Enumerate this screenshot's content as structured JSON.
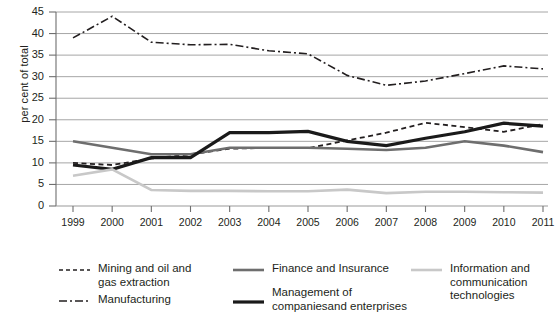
{
  "chart_data": {
    "type": "line",
    "title": "",
    "xlabel": "",
    "ylabel": "per cent of total",
    "ylim": [
      0,
      45
    ],
    "ytick_step": 5,
    "yticks": [
      0,
      5,
      10,
      15,
      20,
      25,
      30,
      35,
      40,
      45
    ],
    "grid": true,
    "legend_position": "bottom",
    "categories": [
      "1999",
      "2000",
      "2001",
      "2002",
      "2003",
      "2004",
      "2005",
      "2006",
      "2007",
      "2008",
      "2009",
      "2010",
      "2011"
    ],
    "series": [
      {
        "name": "Mining and oil and gas extraction",
        "style": "dashed",
        "color": "#231f20",
        "values": [
          10.0,
          9.5,
          11.0,
          12.0,
          13.3,
          13.5,
          13.4,
          15.2,
          17.0,
          19.3,
          18.3,
          17.2,
          19.0
        ]
      },
      {
        "name": "Manufacturing",
        "style": "dash-dot",
        "color": "#231f20",
        "values": [
          39.0,
          44.0,
          38.0,
          37.4,
          37.5,
          36.0,
          35.3,
          30.3,
          28.0,
          29.0,
          30.7,
          32.5,
          31.8
        ]
      },
      {
        "name": "Finance and Insurance",
        "style": "solid",
        "color": "#6e6e6e",
        "values": [
          15.0,
          13.5,
          12.0,
          12.0,
          13.5,
          13.5,
          13.5,
          13.3,
          13.0,
          13.5,
          15.0,
          14.0,
          12.5
        ]
      },
      {
        "name": "Management of companiesand enterprises",
        "style": "solid-bold",
        "color": "#1a1a1a",
        "values": [
          9.5,
          8.5,
          11.2,
          11.2,
          17.0,
          17.0,
          17.3,
          15.0,
          14.0,
          15.7,
          17.2,
          19.2,
          18.5
        ]
      },
      {
        "name": "Information and communication technologies",
        "style": "solid-light",
        "color": "#c8c8c8",
        "values": [
          7.0,
          8.5,
          3.7,
          3.5,
          3.5,
          3.4,
          3.4,
          3.8,
          3.0,
          3.3,
          3.3,
          3.2,
          3.1
        ]
      }
    ]
  },
  "axis": {
    "ylabel": "per cent of total",
    "ytick_labels": [
      "45",
      "40",
      "35",
      "30",
      "25",
      "20",
      "15",
      "10",
      "5",
      "0"
    ],
    "xtick_labels": [
      "1999",
      "2000",
      "2001",
      "2002",
      "2003",
      "2004",
      "2005",
      "2006",
      "2007",
      "2008",
      "2009",
      "2010",
      "2011"
    ]
  },
  "legend": {
    "items": [
      {
        "key": "mining",
        "label": "Mining and oil and\ngas extraction",
        "style": "dashed",
        "color": "#231f20"
      },
      {
        "key": "manu",
        "label": "Manufacturing",
        "style": "dash-dot",
        "color": "#231f20"
      },
      {
        "key": "finance",
        "label": "Finance and Insurance",
        "style": "solid",
        "color": "#6e6e6e"
      },
      {
        "key": "mgmt",
        "label": "Management of\ncompaniesand enterprises",
        "style": "solid-bold",
        "color": "#1a1a1a"
      },
      {
        "key": "ict",
        "label": "Information and\ncommunication\ntechnologies",
        "style": "solid-light",
        "color": "#c8c8c8"
      }
    ]
  },
  "colors": {
    "grid": "#a6a6a6",
    "axis": "#6e6e6e",
    "text": "#231f20",
    "background": "#ffffff"
  }
}
